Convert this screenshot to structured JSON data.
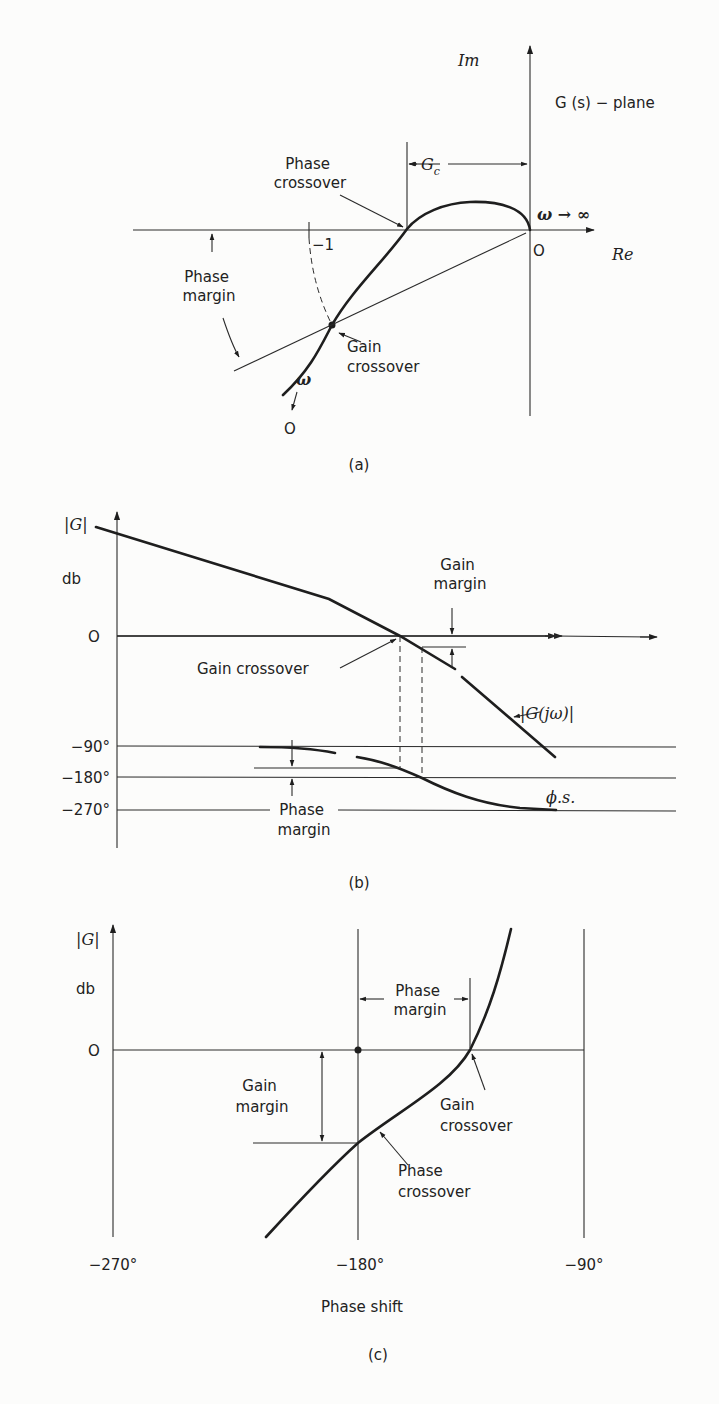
{
  "figure": {
    "panel_a": {
      "caption": "(a)",
      "plane_label": "G (s) − plane",
      "axis_im": "Im",
      "axis_re": "Re",
      "origin": "O",
      "minus_one": "−1",
      "omega_inf": "ω → ∞",
      "omega_symbol": "ω",
      "omega_zero": "O",
      "gc_label": "G",
      "gc_sub": "c",
      "phase_crossover": [
        "Phase",
        "crossover"
      ],
      "phase_margin": [
        "Phase",
        "margin"
      ],
      "gain_crossover": [
        "Gain",
        "crossover"
      ]
    },
    "panel_b": {
      "caption": "(b)",
      "y_label": "|G|",
      "y_unit": "db",
      "zero": "O",
      "ticks": [
        "−90°",
        "−180°",
        "−270°"
      ],
      "gain_margin": [
        "Gain",
        "margin"
      ],
      "gain_crossover": "Gain crossover",
      "magnitude_label": "|G(jω)|",
      "phase_label": "ϕ.s.",
      "phase_margin": [
        "Phase",
        "margin"
      ]
    },
    "panel_c": {
      "caption": "(c)",
      "y_label": "|G|",
      "y_unit": "db",
      "zero": "O",
      "phase_margin": [
        "Phase",
        "margin"
      ],
      "gain_margin": [
        "Gain",
        "margin"
      ],
      "gain_crossover": [
        "Gain",
        "crossover"
      ],
      "phase_crossover": [
        "Phase",
        "crossover"
      ],
      "x_ticks": [
        "−270°",
        "−180°",
        "−90°"
      ],
      "x_label": "Phase shift"
    }
  }
}
